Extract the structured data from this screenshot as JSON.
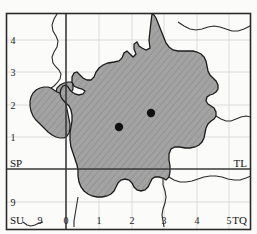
{
  "figure": {
    "kind": "distribution-map",
    "background_color": "#fbfbfa",
    "frame_color": "#2b2b2b"
  },
  "map": {
    "land_fill": "#a3a3a3",
    "land_stroke": "#1c1c1c",
    "hatch_color": "#8d8d8d",
    "coastline_color": "#2a2a2a",
    "grid_color": "#d9d9d9",
    "major_grid_color": "#3a3a3a",
    "dot_color": "#111111"
  },
  "axes": {
    "x_ticks": [
      {
        "label": "0",
        "x": 66
      },
      {
        "label": "1",
        "x": 99
      },
      {
        "label": "2",
        "x": 132
      },
      {
        "label": "3",
        "x": 164
      },
      {
        "label": "4",
        "x": 197
      },
      {
        "label": "5",
        "x": 229
      }
    ],
    "y_ticks": [
      {
        "label": "4",
        "y": 40
      },
      {
        "label": "3",
        "y": 72
      },
      {
        "label": "2",
        "y": 105
      },
      {
        "label": "1",
        "y": 137
      },
      {
        "label": "9",
        "y": 202
      }
    ],
    "x_left_tick": {
      "label": "9",
      "x": 38
    }
  },
  "grid_squares": {
    "top_left": "SP",
    "top_right": "TL",
    "bottom_left": "SU",
    "bottom_right": "TQ"
  },
  "records": [
    {
      "name": "record-point-1",
      "cx": 119,
      "cy": 127,
      "r": 4.2
    },
    {
      "name": "record-point-2",
      "cx": 151,
      "cy": 113,
      "r": 4.2
    }
  ],
  "geometry": {
    "land_polygon": "M 152,14 L 151,22 L 150,31 L 149,40 L 150,48 L 146,50 L 142,48 L 139,46 L 137,42 L 134,44 L 134,49 L 136,54 L 133,57 L 130,54 L 127,51 L 124,53 L 122,58 L 119,61 L 114,62 L 108,63 L 103,65 L 99,68 L 96,72 L 94,77 L 91,80 L 87,80 L 83,78 L 80,75 L 77,72 L 74,73 L 72,77 L 72,82 L 74,86 L 78,88 L 82,89 L 85,91 L 83,94 L 79,95 L 75,94 L 72,92 L 70,90 L 68,87 L 66,85 L 63,86 L 61,89 L 60,93 L 61,97 L 63,100 L 66,103 L 69,106 L 71,110 L 72,115 L 72,121 L 71,127 L 70,133 L 70,140 L 71,147 L 73,153 L 75,159 L 77,165 L 78,170 L 78,176 L 79,182 L 81,187 L 84,191 L 88,194 L 92,196 L 97,197 L 102,197 L 107,196 L 111,194 L 114,191 L 116,187 L 118,183 L 121,180 L 125,179 L 129,180 L 132,183 L 134,187 L 137,190 L 141,191 L 145,190 L 148,187 L 150,183 L 152,179 L 155,177 L 159,177 L 163,178 L 166,180 L 169,177 L 170,172 L 170,166 L 169,160 L 169,154 L 171,149 L 175,147 L 180,147 L 185,148 L 190,148 L 195,147 L 199,145 L 202,142 L 204,138 L 205,133 L 206,128 L 208,124 L 211,121 L 214,119 L 216,116 L 216,112 L 214,108 L 211,106 L 208,104 L 206,101 L 207,97 L 210,95 L 213,94 L 216,92 L 218,89 L 218,85 L 216,81 L 213,78 L 210,75 L 208,71 L 207,66 L 206,61 L 204,57 L 201,54 L 197,52 L 193,51 L 188,51 L 183,51 L 178,51 L 173,50 L 169,47 L 166,43 L 164,38 L 162,33 L 160,28 L 158,23 L 156,18 L 154,15 Z",
    "land_west_lobe": "M 60,93 L 57,92 L 54,90 L 51,88 L 48,87 L 44,87 L 40,88 L 36,90 L 33,93 L 31,97 L 30,101 L 30,106 L 31,111 L 33,116 L 36,120 L 40,124 L 44,128 L 48,132 L 52,135 L 56,137 L 60,138 L 64,138 L 67,136 L 69,133 L 70,129 L 70,124 L 69,119 L 68,114 L 67,109 L 66,104 L 64,100 L 62,96 Z",
    "land_nw_patch": "M 72,82 L 68,82 L 64,83 L 60,85 L 57,88 L 56,92 L 57,96 L 60,98 L 64,98 L 68,96 L 71,93 L 73,89 L 73,85 Z",
    "coastline_north": "M 56,2 L 58,8 L 57,14 L 54,19 L 52,25 L 53,31 L 56,36 L 58,41 L 57,47 L 54,52 L 52,57 L 53,63 L 56,67 L 59,70 L 61,74 L 60,79 L 57,83 L 54,86 L 51,88",
    "coastline_ne": "M 178,22 L 184,26 L 190,29 L 196,30 L 202,29 L 208,27 L 214,26 L 220,27 L 226,29 L 232,31 L 238,31 L 244,29 L 250,26 L 255,24",
    "coastline_east": "M 216,116 L 221,119 L 226,121 L 231,121 L 236,119 L 241,117 L 246,116 L 251,117 L 255,119",
    "coastline_se": "M 169,177 L 174,180 L 180,182 L 186,182 L 192,181 L 198,179 L 204,177 L 210,176 L 216,176 L 222,177 L 228,179 L 234,180 L 240,180 L 246,178 L 251,176 L 255,174",
    "river_south": "M 163,178 L 163,185 L 165,191 L 166,197 L 165,203 L 163,209 L 162,215 L 163,221 L 164,227",
    "river_west": "M 78,197 L 77,203 L 76,209 L 75,215 L 74,221 L 74,227",
    "coast_su_squiggle": "M 23,222 L 27,225 L 31,226 L 35,225 L 39,223 L 43,222"
  }
}
